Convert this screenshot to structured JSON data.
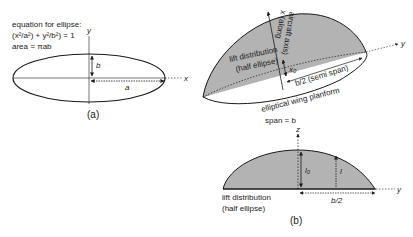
{
  "figure_a": {
    "equation_title": "equation for ellipse:",
    "equation": "(x²/a²) + y²/b²) = 1",
    "area": "area = πab",
    "axis_x": "x",
    "axis_y": "y",
    "label_a": "a",
    "label_b": "b",
    "caption": "(a)"
  },
  "figure_3d": {
    "lift_label_line1": "lift distribution",
    "lift_label_line2": "(half ellipse)",
    "x_axis_line1": "x (along",
    "x_axis_line2": "aircraft axis)",
    "x0_label": "x₀",
    "semi_span_label": "b/2 (semi span)",
    "planform_label": "elliptical wing planform",
    "span_label": "span = b",
    "axis_y": "y"
  },
  "figure_b": {
    "axis_z": "z",
    "axis_y": "y",
    "l0_label": "l₀",
    "l_label": "l",
    "half_span_label": "b/2",
    "lift_label_line1": "lift distribution",
    "lift_label_line2": "(half ellipse)",
    "caption": "(b)"
  },
  "colors": {
    "fill": "#b3b3b3",
    "stroke": "#1a1a1a"
  }
}
